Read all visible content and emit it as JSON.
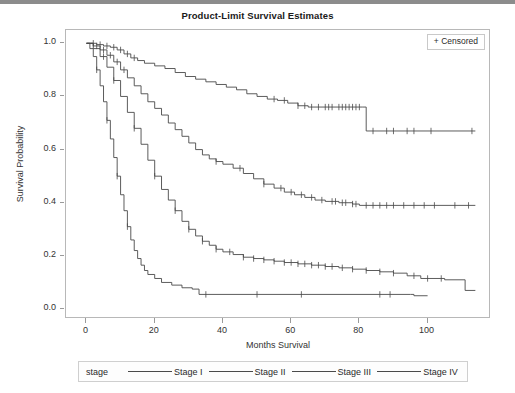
{
  "chart_data": {
    "type": "line",
    "title": "Product-Limit Survival Estimates",
    "xlabel": "Months Survival",
    "ylabel": "Survival Probability",
    "xlim": [
      -6,
      118
    ],
    "ylim": [
      -0.03,
      1.05
    ],
    "xticks": [
      0,
      20,
      40,
      60,
      80,
      100
    ],
    "xtick_labels": [
      "0",
      "20",
      "40",
      "60",
      "80",
      "100"
    ],
    "yticks": [
      0.0,
      0.2,
      0.4,
      0.6,
      0.8,
      1.0
    ],
    "ytick_labels": [
      "0.0",
      "0.2",
      "0.4",
      "0.6",
      "0.8",
      "1.0"
    ],
    "grid": false,
    "legend_position": "bottom",
    "legend_title": "stage",
    "censor_marker_label": "+ Censored",
    "censor_marker_symbol": "+",
    "line_color": "#4a4a4a",
    "series": [
      {
        "name": "Stage I",
        "final_value": 0.67,
        "steps": [
          [
            0,
            1.0
          ],
          [
            3,
            0.995
          ],
          [
            5,
            0.99
          ],
          [
            7,
            0.985
          ],
          [
            9,
            0.975
          ],
          [
            11,
            0.96
          ],
          [
            13,
            0.945
          ],
          [
            15,
            0.935
          ],
          [
            17,
            0.925
          ],
          [
            20,
            0.915
          ],
          [
            23,
            0.905
          ],
          [
            26,
            0.89
          ],
          [
            29,
            0.875
          ],
          [
            32,
            0.865
          ],
          [
            35,
            0.855
          ],
          [
            38,
            0.845
          ],
          [
            41,
            0.835
          ],
          [
            44,
            0.825
          ],
          [
            47,
            0.81
          ],
          [
            50,
            0.8
          ],
          [
            53,
            0.79
          ],
          [
            56,
            0.785
          ],
          [
            59,
            0.775
          ],
          [
            62,
            0.765
          ],
          [
            65,
            0.76
          ],
          [
            81,
            0.76
          ],
          [
            82,
            0.67
          ],
          [
            114,
            0.67
          ]
        ],
        "censor_times": [
          2,
          4,
          6,
          8,
          10,
          12,
          14,
          55,
          58,
          62,
          64,
          66,
          68,
          70,
          71,
          72,
          74,
          75,
          76,
          77,
          78,
          79,
          80,
          84,
          88,
          90,
          94,
          96,
          101,
          113
        ]
      },
      {
        "name": "Stage II",
        "final_value": 0.39,
        "steps": [
          [
            0,
            1.0
          ],
          [
            2,
            0.99
          ],
          [
            4,
            0.975
          ],
          [
            6,
            0.955
          ],
          [
            8,
            0.93
          ],
          [
            10,
            0.9
          ],
          [
            12,
            0.87
          ],
          [
            14,
            0.84
          ],
          [
            16,
            0.81
          ],
          [
            18,
            0.78
          ],
          [
            20,
            0.755
          ],
          [
            22,
            0.73
          ],
          [
            24,
            0.7
          ],
          [
            26,
            0.675
          ],
          [
            28,
            0.65
          ],
          [
            30,
            0.625
          ],
          [
            32,
            0.6
          ],
          [
            34,
            0.58
          ],
          [
            36,
            0.565
          ],
          [
            38,
            0.555
          ],
          [
            40,
            0.545
          ],
          [
            43,
            0.53
          ],
          [
            46,
            0.51
          ],
          [
            49,
            0.49
          ],
          [
            52,
            0.47
          ],
          [
            55,
            0.455
          ],
          [
            58,
            0.44
          ],
          [
            61,
            0.43
          ],
          [
            64,
            0.42
          ],
          [
            67,
            0.41
          ],
          [
            70,
            0.405
          ],
          [
            74,
            0.4
          ],
          [
            78,
            0.395
          ],
          [
            80,
            0.39
          ],
          [
            114,
            0.39
          ]
        ],
        "censor_times": [
          3,
          5,
          7,
          9,
          11,
          38,
          45,
          52,
          57,
          60,
          63,
          66,
          69,
          72,
          73,
          75,
          76,
          78,
          79,
          82,
          84,
          86,
          88,
          90,
          93,
          96,
          99,
          102,
          108,
          112
        ]
      },
      {
        "name": "Stage III",
        "final_value": 0.07,
        "steps": [
          [
            0,
            1.0
          ],
          [
            2,
            0.98
          ],
          [
            4,
            0.95
          ],
          [
            6,
            0.91
          ],
          [
            8,
            0.86
          ],
          [
            10,
            0.8
          ],
          [
            12,
            0.74
          ],
          [
            14,
            0.68
          ],
          [
            16,
            0.62
          ],
          [
            18,
            0.56
          ],
          [
            20,
            0.5
          ],
          [
            22,
            0.45
          ],
          [
            24,
            0.41
          ],
          [
            26,
            0.37
          ],
          [
            28,
            0.33
          ],
          [
            30,
            0.3
          ],
          [
            32,
            0.275
          ],
          [
            34,
            0.255
          ],
          [
            36,
            0.24
          ],
          [
            38,
            0.225
          ],
          [
            40,
            0.215
          ],
          [
            43,
            0.205
          ],
          [
            46,
            0.195
          ],
          [
            49,
            0.19
          ],
          [
            52,
            0.185
          ],
          [
            55,
            0.18
          ],
          [
            58,
            0.175
          ],
          [
            62,
            0.17
          ],
          [
            66,
            0.165
          ],
          [
            70,
            0.16
          ],
          [
            74,
            0.155
          ],
          [
            78,
            0.15
          ],
          [
            82,
            0.145
          ],
          [
            86,
            0.14
          ],
          [
            90,
            0.135
          ],
          [
            94,
            0.125
          ],
          [
            98,
            0.115
          ],
          [
            105,
            0.11
          ],
          [
            111,
            0.07
          ],
          [
            114,
            0.07
          ]
        ],
        "censor_times": [
          5,
          8,
          14,
          20,
          26,
          30,
          34,
          38,
          42,
          46,
          49,
          52,
          55,
          58,
          60,
          62,
          64,
          66,
          68,
          70,
          72,
          75,
          78,
          82,
          86,
          90,
          96,
          100,
          104
        ]
      },
      {
        "name": "Stage IV",
        "final_value": 0.05,
        "steps": [
          [
            0,
            1.0
          ],
          [
            1,
            0.98
          ],
          [
            2,
            0.95
          ],
          [
            3,
            0.9
          ],
          [
            4,
            0.84
          ],
          [
            5,
            0.78
          ],
          [
            6,
            0.71
          ],
          [
            7,
            0.64
          ],
          [
            8,
            0.57
          ],
          [
            9,
            0.5
          ],
          [
            10,
            0.43
          ],
          [
            11,
            0.37
          ],
          [
            12,
            0.31
          ],
          [
            13,
            0.26
          ],
          [
            14,
            0.22
          ],
          [
            15,
            0.19
          ],
          [
            16,
            0.165
          ],
          [
            17,
            0.145
          ],
          [
            18,
            0.13
          ],
          [
            20,
            0.115
          ],
          [
            22,
            0.1
          ],
          [
            25,
            0.09
          ],
          [
            28,
            0.08
          ],
          [
            31,
            0.075
          ],
          [
            33,
            0.055
          ],
          [
            95,
            0.055
          ],
          [
            96,
            0.05
          ],
          [
            100,
            0.05
          ]
        ],
        "censor_times": [
          3,
          6,
          9,
          12,
          35,
          50,
          63,
          86,
          89
        ]
      }
    ]
  }
}
